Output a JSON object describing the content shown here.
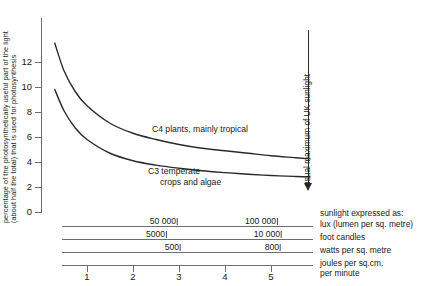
{
  "chart_data": {
    "type": "line",
    "title": "",
    "ylabel": "percentage of the photosynthetically useful part of the light (about half the total) that is used for photosynthesis",
    "xlabel": "joules per sq.cm. per minute",
    "ylim": [
      0,
      14
    ],
    "xlim": [
      0,
      6
    ],
    "yticks": [
      0,
      2,
      4,
      6,
      8,
      10,
      12
    ],
    "xticks": [
      1,
      2,
      3,
      4,
      5
    ],
    "grid": false,
    "legend_position": "inline-curve-labels",
    "series": [
      {
        "name": "C4 plants, mainly tropical",
        "x": [
          0.3,
          0.5,
          0.75,
          1.0,
          1.5,
          2.0,
          2.5,
          3.0,
          3.5,
          4.0,
          4.5,
          5.0,
          5.5,
          5.85
        ],
        "values": [
          13.5,
          11.3,
          9.6,
          8.5,
          7.1,
          6.3,
          5.8,
          5.4,
          5.1,
          4.9,
          4.7,
          4.5,
          4.35,
          4.25
        ]
      },
      {
        "name": "C3 temperate crops and algae",
        "x": [
          0.3,
          0.5,
          0.75,
          1.0,
          1.5,
          2.0,
          2.5,
          3.0,
          3.5,
          4.0,
          4.5,
          5.0,
          5.5,
          5.85
        ],
        "values": [
          9.8,
          8.1,
          6.7,
          5.8,
          4.7,
          4.1,
          3.75,
          3.5,
          3.3,
          3.15,
          3.02,
          2.92,
          2.85,
          2.8
        ]
      }
    ],
    "annotations": [
      {
        "text": "usual maximum of UK sunlight",
        "x": 5.45,
        "orientation": "vertical",
        "arrow": "down"
      }
    ],
    "alternate_scales": {
      "header": "sunlight expressed as:",
      "rows": [
        {
          "unit": "lux (lumen per sq. metre)",
          "ticks": [
            {
              "label": "50 000",
              "x": 2.45
            },
            {
              "label": "100 000",
              "x": 4.72
            }
          ]
        },
        {
          "unit": "foot candles",
          "ticks": [
            {
              "label": "5000",
              "x": 2.2
            },
            {
              "label": "10 000",
              "x": 4.8
            }
          ]
        },
        {
          "unit": "watts per sq. metre",
          "ticks": [
            {
              "label": "500",
              "x": 2.52
            },
            {
              "label": "800",
              "x": 4.78
            }
          ]
        },
        {
          "unit": "joules per sq.cm. per minute",
          "ticks": []
        }
      ]
    }
  },
  "axes": {
    "ylabel_line1": "percentage of the photosynthetically useful part of the light",
    "ylabel_line2": "(about half the total) that is used for photosynthesis",
    "ytick_labels": [
      "0",
      "2",
      "4",
      "6",
      "8",
      "10",
      "12"
    ],
    "xtick_labels": [
      "1",
      "2",
      "3",
      "4",
      "5"
    ]
  },
  "curve_labels": {
    "c4": "C4 plants, mainly tropical",
    "c3_line1": "C3 temperate",
    "c3_line2": "crops and algae"
  },
  "annotation": {
    "uk_sunlight": "usual maximum of UK sunlight"
  },
  "scales": {
    "header": "sunlight expressed as:",
    "lux_unit": "lux (lumen per sq. metre)",
    "foot_unit": "foot candles",
    "watts_unit": "watts per sq. metre",
    "joules_unit_line1": "joules per sq.cm.",
    "joules_unit_line2": "per minute",
    "lux_v1": "50 000",
    "lux_v2": "100 000",
    "foot_v1": "5000",
    "foot_v2": "10 000",
    "watts_v1": "500",
    "watts_v2": "800"
  },
  "colors": {
    "curve": "#2a2a2a",
    "axis": "#6d6d6d",
    "text": "#1a1a1a",
    "background": "#ffffff"
  }
}
